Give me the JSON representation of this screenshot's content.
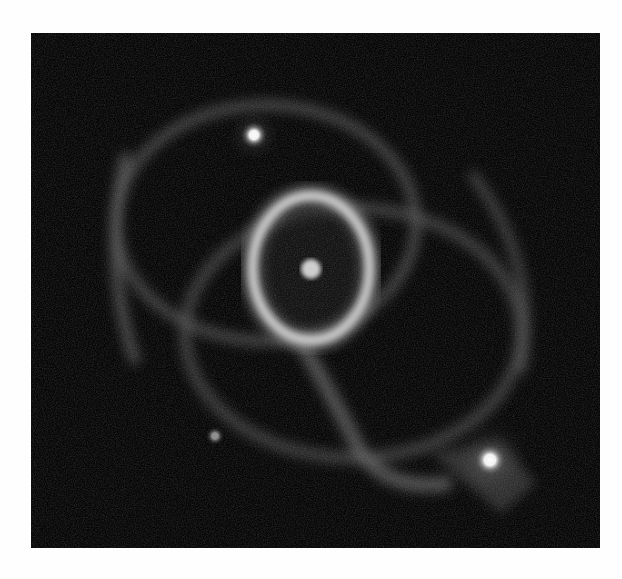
{
  "image": {
    "subject": "supernova remnant with inner ring and two outer rings",
    "palette": "grayscale",
    "background_color": "#050505",
    "page_color": "#fefefe"
  },
  "features": {
    "inner_ring": {
      "cx": 280,
      "cy": 235,
      "rx": 58,
      "ry": 72
    },
    "central_source": {
      "cx": 280,
      "cy": 236,
      "r": 9
    },
    "outer_ring_upper": {
      "cx": 235,
      "cy": 190,
      "rx": 150,
      "ry": 115
    },
    "outer_ring_lower": {
      "cx": 320,
      "cy": 300,
      "rx": 170,
      "ry": 125
    },
    "stars": [
      {
        "name": "bright-star-upper-left",
        "cx": 223,
        "cy": 102,
        "r": 11
      },
      {
        "name": "bright-star-lower-right",
        "cx": 459,
        "cy": 427,
        "r": 14
      },
      {
        "name": "faint-star-lower-left",
        "cx": 184,
        "cy": 403,
        "r": 7
      }
    ]
  }
}
